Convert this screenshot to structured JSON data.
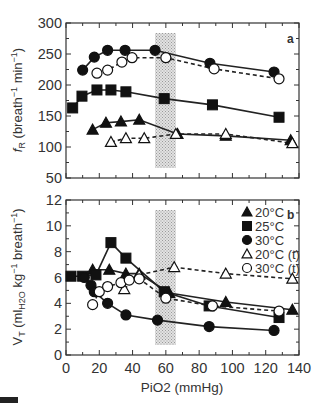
{
  "figure": {
    "x_axis_label": "PiO2 (mmHg)",
    "x_ticks": [
      "0",
      "20",
      "40",
      "60",
      "80",
      "100",
      "120",
      "140"
    ],
    "shaded_region_label": "hypoxic threshold band"
  },
  "chart_data": [
    {
      "type": "line",
      "panel": "a",
      "title": "",
      "xlabel": "PiO2 (mmHg)",
      "ylabel": "fR (breath⁻¹ min⁻¹)",
      "xlim": [
        0,
        140
      ],
      "ylim": [
        50,
        300
      ],
      "y_ticks": [
        50,
        100,
        150,
        200,
        250,
        300
      ],
      "shaded_x_range": [
        53.5,
        66
      ],
      "grid": false,
      "series": [
        {
          "name": "20°C",
          "marker": "filled-triangle",
          "line": "solid",
          "x": [
            16,
            24,
            33,
            44,
            67,
            96,
            135
          ],
          "y": [
            128,
            139,
            141,
            144,
            121,
            118,
            111
          ]
        },
        {
          "name": "25°C",
          "marker": "filled-square",
          "line": "solid",
          "x": [
            4,
            9.6,
            18.6,
            27,
            36,
            59,
            88,
            128
          ],
          "y": [
            163,
            182,
            192,
            192,
            189,
            178,
            168,
            148
          ]
        },
        {
          "name": "30°C",
          "marker": "filled-circle",
          "line": "solid",
          "x": [
            10,
            17,
            25,
            35.5,
            53.5,
            86.5,
            125
          ],
          "y": [
            224,
            245,
            256,
            256,
            256,
            235,
            221
          ]
        },
        {
          "name": "20°C (t)",
          "marker": "open-triangle",
          "line": "dashed",
          "x": [
            27,
            36,
            47,
            66,
            96,
            136
          ],
          "y": [
            108,
            114,
            114,
            121,
            121,
            106
          ]
        },
        {
          "name": "30°C (t)",
          "marker": "open-circle",
          "line": "dashed",
          "x": [
            18.6,
            25,
            33.6,
            39.7,
            60,
            89,
            128
          ],
          "y": [
            219,
            224,
            237,
            244,
            244,
            226,
            210
          ]
        }
      ]
    },
    {
      "type": "line",
      "panel": "b",
      "title": "",
      "xlabel": "PiO2 (mmHg)",
      "ylabel": "VT (mlH2O kg⁻¹ breath⁻¹)",
      "xlim": [
        0,
        140
      ],
      "ylim": [
        0,
        12
      ],
      "y_ticks": [
        0,
        2,
        4,
        6,
        8,
        10,
        12
      ],
      "shaded_x_range": [
        53.5,
        66
      ],
      "grid": false,
      "legend_position": "upper right",
      "legend": [
        "20°C",
        "25°C",
        "30°C",
        "20°C (t)",
        "30°C (t)"
      ],
      "series": [
        {
          "name": "20°C",
          "marker": "filled-triangle",
          "line": "solid",
          "x": [
            16,
            26,
            36,
            44,
            62,
            96,
            136
          ],
          "y": [
            6.6,
            6.6,
            6.3,
            6.3,
            4.8,
            4.1,
            3.5
          ]
        },
        {
          "name": "25°C",
          "marker": "filled-square",
          "line": "solid",
          "x": [
            3,
            10,
            18,
            27,
            36,
            59,
            86,
            128
          ],
          "y": [
            6.1,
            6.1,
            6.2,
            8.7,
            7.5,
            4.9,
            3.8,
            2.9
          ]
        },
        {
          "name": "30°C",
          "marker": "filled-circle",
          "line": "solid",
          "x": [
            11,
            15,
            17,
            25,
            36,
            55,
            86,
            125
          ],
          "y": [
            6.0,
            5.4,
            4.9,
            4.0,
            3.1,
            2.7,
            2.2,
            1.9
          ]
        },
        {
          "name": "20°C (t)",
          "marker": "open-triangle",
          "line": "dashed",
          "x": [
            35,
            44,
            65,
            96,
            136
          ],
          "y": [
            5.1,
            6.2,
            6.8,
            6.3,
            5.9
          ]
        },
        {
          "name": "30°C (t)",
          "marker": "open-circle",
          "line": "dashed",
          "x": [
            16,
            20,
            25,
            33,
            38,
            44,
            60,
            88,
            128
          ],
          "y": [
            3.9,
            4.9,
            5.3,
            5.6,
            5.8,
            5.9,
            4.4,
            3.8,
            3.4
          ]
        }
      ]
    }
  ],
  "labels": {
    "panel_a": "a",
    "panel_b": "b",
    "y_label_a_main": "f",
    "y_label_a_sub": "R",
    "y_label_a_rest": " (breath",
    "y_label_a_sup1": "−1",
    "y_label_a_min": " min",
    "y_label_a_sup2": "−1",
    "y_label_a_close": ")",
    "y_label_b": "VT (mlH2O kg−1 breath−1)",
    "x_label": "PiO2  (mmHg)"
  }
}
